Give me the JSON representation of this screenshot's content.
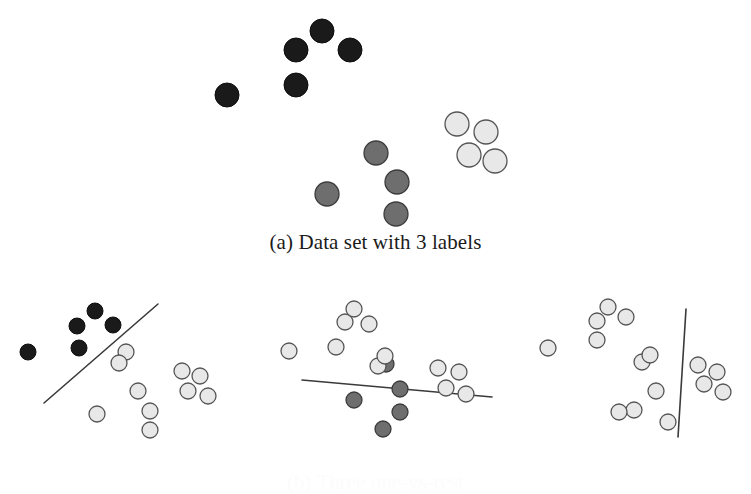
{
  "figure": {
    "background_color": "#ffffff",
    "captions": [
      {
        "id": "a",
        "text": "(a) Data set with 3 labels"
      },
      {
        "id": "b",
        "text": "(b) Three one-vs-rest"
      }
    ]
  },
  "style": {
    "class_dark_fill": "#1a1a1a",
    "class_dark_stroke": "#0d0d0d",
    "class_mid_fill": "#6e6e6e",
    "class_mid_stroke": "#3c3c3c",
    "class_light_fill": "#e8e8e8",
    "class_light_stroke": "#555555",
    "boundary_line_color": "#3a3a3a",
    "boundary_line_width": 1.6
  },
  "chart_data": {
    "type": "scatter",
    "title": "(a) Data set with 3 labels",
    "xlabel": "",
    "ylabel": "",
    "grid": false,
    "legend": "none",
    "panels": [
      {
        "name": "data-set-with-3-labels",
        "caption": "(a) Data set with 3 labels",
        "origin": {
          "x": 0,
          "y": 0
        },
        "size": {
          "width": 751,
          "height": 230
        },
        "point_radius": 12,
        "series": [
          {
            "name": "class-dark",
            "color": "#1a1a1a",
            "points": [
              {
                "x": 227,
                "y": 95
              },
              {
                "x": 296,
                "y": 50
              },
              {
                "x": 322,
                "y": 31
              },
              {
                "x": 350,
                "y": 50
              },
              {
                "x": 296,
                "y": 85
              }
            ]
          },
          {
            "name": "class-mid-gray",
            "color": "#6e6e6e",
            "points": [
              {
                "x": 327,
                "y": 194
              },
              {
                "x": 376,
                "y": 153
              },
              {
                "x": 397,
                "y": 182
              },
              {
                "x": 396,
                "y": 214
              }
            ]
          },
          {
            "name": "class-light-gray",
            "color": "#e8e8e8",
            "points": [
              {
                "x": 457,
                "y": 124
              },
              {
                "x": 486,
                "y": 132
              },
              {
                "x": 469,
                "y": 155
              },
              {
                "x": 495,
                "y": 161
              }
            ]
          }
        ],
        "boundaries": []
      },
      {
        "name": "one-vs-rest-dark",
        "caption": "",
        "origin": {
          "x": 0,
          "y": 255
        },
        "size": {
          "width": 250,
          "height": 200
        },
        "point_radius": 8,
        "series": [
          {
            "name": "class-dark",
            "color": "#1a1a1a",
            "points": [
              {
                "x": 28,
                "y": 352
              },
              {
                "x": 77,
                "y": 326
              },
              {
                "x": 95,
                "y": 311
              },
              {
                "x": 113,
                "y": 325
              },
              {
                "x": 79,
                "y": 348
              }
            ]
          },
          {
            "name": "class-rest-light",
            "color": "#e8e8e8",
            "points": [
              {
                "x": 126,
                "y": 352
              },
              {
                "x": 119,
                "y": 363
              },
              {
                "x": 138,
                "y": 391
              },
              {
                "x": 150,
                "y": 411
              },
              {
                "x": 150,
                "y": 430
              },
              {
                "x": 97,
                "y": 414
              },
              {
                "x": 182,
                "y": 371
              },
              {
                "x": 200,
                "y": 376
              },
              {
                "x": 188,
                "y": 391
              },
              {
                "x": 208,
                "y": 396
              }
            ]
          }
        ],
        "boundaries": [
          {
            "x1": 44,
            "y1": 403,
            "x2": 158,
            "y2": 304
          }
        ]
      },
      {
        "name": "one-vs-rest-mid",
        "caption": "",
        "origin": {
          "x": 255,
          "y": 255
        },
        "size": {
          "width": 250,
          "height": 200
        },
        "point_radius": 8,
        "series": [
          {
            "name": "class-mid-gray",
            "color": "#6e6e6e",
            "points": [
              {
                "x": 386,
                "y": 364
              },
              {
                "x": 354,
                "y": 400
              },
              {
                "x": 400,
                "y": 389
              },
              {
                "x": 400,
                "y": 412
              },
              {
                "x": 383,
                "y": 429
              }
            ]
          },
          {
            "name": "class-rest-light",
            "color": "#e8e8e8",
            "points": [
              {
                "x": 289,
                "y": 351
              },
              {
                "x": 345,
                "y": 322
              },
              {
                "x": 354,
                "y": 309
              },
              {
                "x": 369,
                "y": 324
              },
              {
                "x": 336,
                "y": 347
              },
              {
                "x": 378,
                "y": 366
              },
              {
                "x": 385,
                "y": 356
              },
              {
                "x": 438,
                "y": 368
              },
              {
                "x": 459,
                "y": 372
              },
              {
                "x": 446,
                "y": 388
              },
              {
                "x": 466,
                "y": 394
              }
            ]
          }
        ],
        "boundaries": [
          {
            "x1": 302,
            "y1": 380,
            "x2": 492,
            "y2": 397
          }
        ]
      },
      {
        "name": "one-vs-rest-light",
        "caption": "",
        "origin": {
          "x": 505,
          "y": 255
        },
        "size": {
          "width": 246,
          "height": 200
        },
        "point_radius": 8,
        "series": [
          {
            "name": "class-light-gray",
            "color": "#e8e8e8",
            "points": [
              {
                "x": 698,
                "y": 365
              },
              {
                "x": 717,
                "y": 372
              },
              {
                "x": 704,
                "y": 384
              },
              {
                "x": 723,
                "y": 392
              }
            ]
          },
          {
            "name": "class-rest-light",
            "color": "#e8e8e8",
            "points": [
              {
                "x": 548,
                "y": 348
              },
              {
                "x": 597,
                "y": 321
              },
              {
                "x": 608,
                "y": 307
              },
              {
                "x": 626,
                "y": 317
              },
              {
                "x": 597,
                "y": 340
              },
              {
                "x": 642,
                "y": 362
              },
              {
                "x": 650,
                "y": 355
              },
              {
                "x": 656,
                "y": 391
              },
              {
                "x": 634,
                "y": 410
              },
              {
                "x": 619,
                "y": 412
              },
              {
                "x": 668,
                "y": 422
              }
            ]
          }
        ],
        "boundaries": [
          {
            "x1": 686,
            "y1": 309,
            "x2": 678,
            "y2": 437
          }
        ]
      }
    ]
  }
}
